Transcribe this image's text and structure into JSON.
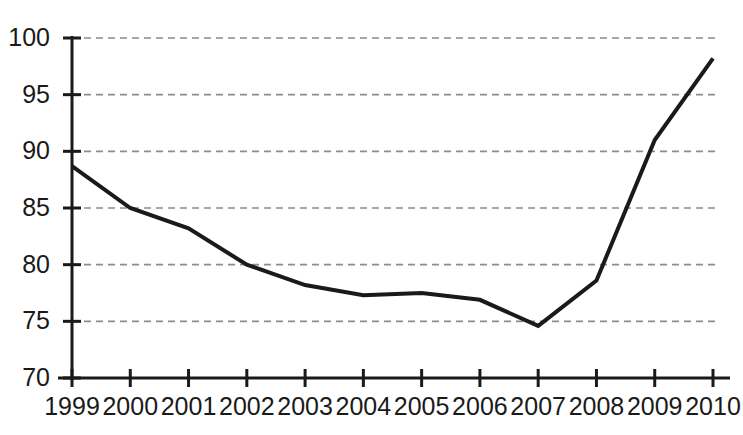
{
  "chart_data": {
    "type": "line",
    "title": "",
    "xlabel": "",
    "ylabel": "",
    "categories": [
      "1999",
      "2000",
      "2001",
      "2002",
      "2003",
      "2004",
      "2005",
      "2006",
      "2007",
      "2008",
      "2009",
      "2010"
    ],
    "values": [
      88.7,
      85.0,
      83.2,
      80.0,
      78.2,
      77.3,
      77.5,
      76.9,
      74.6,
      78.6,
      91.0,
      98.2
    ],
    "series": [
      {
        "name": "series-1",
        "values": [
          88.7,
          85.0,
          83.2,
          80.0,
          78.2,
          77.3,
          77.5,
          76.9,
          74.6,
          78.6,
          91.0,
          98.2
        ]
      }
    ],
    "ylim": [
      70,
      100
    ],
    "yticks": [
      70,
      75,
      80,
      85,
      90,
      95,
      100
    ],
    "ytick_labels": [
      "70",
      "75",
      "80",
      "85",
      "90",
      "95",
      "100"
    ],
    "xtick_labels": [
      "1999",
      "2000",
      "2001",
      "2002",
      "2003",
      "2004",
      "2005",
      "2006",
      "2007",
      "2008",
      "2009",
      "2010"
    ],
    "grid": true,
    "grid_axis": "y",
    "grid_style": "dashed",
    "legend": false,
    "legend_position": "none",
    "line_color": "#1a1a1a",
    "grid_color": "#8c8c8c",
    "axis_color": "#1a1a1a",
    "background_color": "#ffffff",
    "line_width": 4,
    "markers": false
  }
}
